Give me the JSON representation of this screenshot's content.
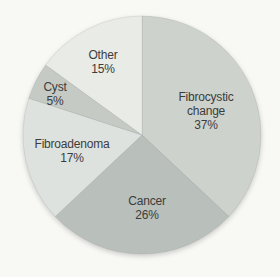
{
  "figure": {
    "background_color": "#f8f8f5"
  },
  "chart_data": {
    "type": "pie",
    "title": "",
    "direction": "clockwise",
    "start_angle_deg": 0,
    "categories": [
      "Fibrocystic change",
      "Cancer",
      "Fibroadenoma",
      "Cyst",
      "Other"
    ],
    "values": [
      37,
      26,
      17,
      5,
      15
    ],
    "unit": "%",
    "legend": "none",
    "labels_on_slices": true,
    "geometry": {
      "cx": 142,
      "cy": 135,
      "r": 119
    },
    "label_line_height": 14,
    "text_color": "#3c3c3c",
    "slice_stroke": "rgba(100,100,100,0.16)",
    "segments": [
      {
        "label": "Fibrocystic change",
        "pct": 37,
        "color": "#cdd2cd",
        "label_lines": [
          "Fibrocystic",
          "change",
          "37%"
        ],
        "label_x": 206,
        "label_y": 101
      },
      {
        "label": "Cancer",
        "pct": 26,
        "color": "#b9bfba",
        "label_lines": [
          "Cancer",
          "26%"
        ],
        "label_x": 147,
        "label_y": 205
      },
      {
        "label": "Fibroadenoma",
        "pct": 17,
        "color": "#dee2de",
        "label_lines": [
          "Fibroadenoma",
          "17%"
        ],
        "label_x": 72,
        "label_y": 148
      },
      {
        "label": "Cyst",
        "pct": 5,
        "color": "#c5cac5",
        "label_lines": [
          "Cyst",
          "5%"
        ],
        "label_x": 55,
        "label_y": 91
      },
      {
        "label": "Other",
        "pct": 15,
        "color": "#e9ebe6",
        "label_lines": [
          "Other",
          "15%"
        ],
        "label_x": 103,
        "label_y": 59
      }
    ]
  }
}
